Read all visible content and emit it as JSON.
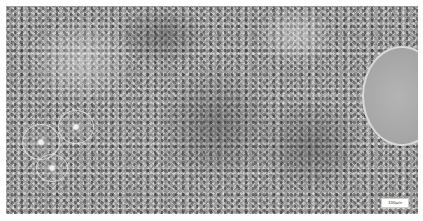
{
  "image": {
    "description": "Grayscale histology micrograph of lymphoid tissue with a large follicle on the right and small vessel profiles on the left",
    "background_color": "#ffffff",
    "tissue_base_color": "#9a9a9a"
  },
  "regions": {
    "large_follicle": "pale round follicle",
    "small_follicles": [
      "vessel-left-1",
      "vessel-left-2",
      "vessel-left-3"
    ]
  },
  "scale_bar": {
    "label": "100µm"
  }
}
